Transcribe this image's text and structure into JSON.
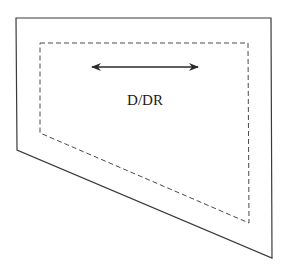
{
  "diagram": {
    "label": "D/DR",
    "outer_shape": {
      "points": [
        [
          16,
          18
        ],
        [
          271,
          18
        ],
        [
          272,
          258
        ],
        [
          17,
          150
        ]
      ],
      "stroke": "#3a3a3a",
      "style": "solid"
    },
    "inner_shape": {
      "points": [
        [
          40,
          43
        ],
        [
          248,
          43
        ],
        [
          249,
          223
        ],
        [
          40,
          133
        ]
      ],
      "stroke": "#4a4a4a",
      "style": "dashed"
    },
    "arrow": {
      "type": "double-headed",
      "x1": 90,
      "y1": 67,
      "x2": 200,
      "y2": 67,
      "color": "#2a2a2a"
    }
  }
}
